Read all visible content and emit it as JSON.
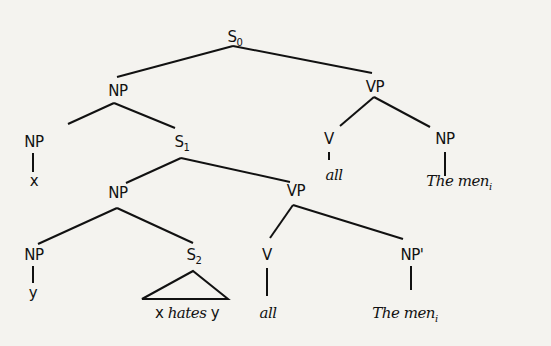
{
  "diagram": {
    "type": "syntax-tree",
    "nodes": {
      "s0": {
        "label": "S",
        "sub": "0"
      },
      "np_top": {
        "label": "NP"
      },
      "vp_top": {
        "label": "VP"
      },
      "np_x": {
        "label": "NP"
      },
      "s1": {
        "label": "S",
        "sub": "1"
      },
      "v_top": {
        "label": "V"
      },
      "np_men_top": {
        "label": "NP"
      },
      "x_leaf": {
        "label": "x"
      },
      "all_top": {
        "label": "all"
      },
      "men_top": {
        "label": "The men",
        "sub": "i"
      },
      "np_mid": {
        "label": "NP"
      },
      "vp_mid": {
        "label": "VP"
      },
      "np_y": {
        "label": "NP"
      },
      "s2": {
        "label": "S",
        "sub": "2"
      },
      "v_mid": {
        "label": "V"
      },
      "np_prime": {
        "label": "NP'"
      },
      "y_leaf": {
        "label": "y"
      },
      "s2_leaf_x": {
        "label": "x"
      },
      "s2_leaf_hates": {
        "label": "hates"
      },
      "s2_leaf_y": {
        "label": "y"
      },
      "all_mid": {
        "label": "all"
      },
      "men_mid": {
        "label": "The men",
        "sub": "i"
      }
    },
    "edges": [
      [
        "s0",
        "np_top"
      ],
      [
        "s0",
        "vp_top"
      ],
      [
        "np_top",
        "np_x"
      ],
      [
        "np_top",
        "s1"
      ],
      [
        "vp_top",
        "v_top"
      ],
      [
        "vp_top",
        "np_men_top"
      ],
      [
        "np_x",
        "x_leaf"
      ],
      [
        "v_top",
        "all_top"
      ],
      [
        "np_men_top",
        "men_top"
      ],
      [
        "s1",
        "np_mid"
      ],
      [
        "s1",
        "vp_mid"
      ],
      [
        "np_mid",
        "np_y"
      ],
      [
        "np_mid",
        "s2"
      ],
      [
        "vp_mid",
        "v_mid"
      ],
      [
        "vp_mid",
        "np_prime"
      ],
      [
        "np_y",
        "y_leaf"
      ],
      [
        "s2",
        "triangle:x hates y"
      ],
      [
        "v_mid",
        "all_mid"
      ],
      [
        "np_prime",
        "men_mid"
      ]
    ]
  }
}
